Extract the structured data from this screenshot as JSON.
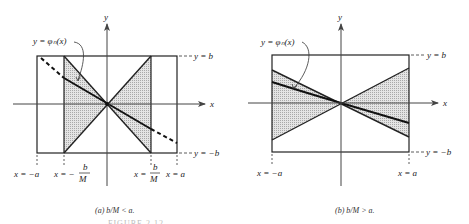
{
  "figure": {
    "panel_a": {
      "y_axis_label": "y",
      "x_axis_label": "x",
      "curve_label": "y = φₙ(x)",
      "top_label": "y = b",
      "bottom_label": "y = −b",
      "x_labels": {
        "neg_a": "x = −a",
        "neg_bm_prefix": "x = −",
        "pos_bm_prefix": "x =",
        "pos_a": "x = a",
        "frac_num": "b",
        "frac_den": "M"
      },
      "caption": "(a) b/M < a."
    },
    "panel_b": {
      "y_axis_label": "y",
      "x_axis_label": "x",
      "curve_label": "y = φₙ(x)",
      "top_label": "y = b",
      "bottom_label": "y = −b",
      "x_labels": {
        "neg_a": "x = −a",
        "pos_a": "x = a"
      },
      "caption": "(b) b/M > a."
    },
    "figure_caption_partial": "FIGURE 2.12"
  },
  "colors": {
    "line": "#222222",
    "shade": "#d6d6d6",
    "axis": "#444444"
  }
}
